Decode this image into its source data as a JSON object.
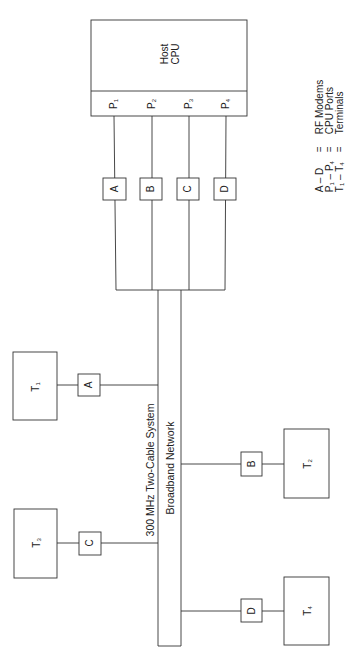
{
  "diagram": {
    "host": {
      "line1": "Host",
      "line2": "CPU"
    },
    "ports": [
      {
        "letter": "P",
        "sub": "1"
      },
      {
        "letter": "P",
        "sub": "2"
      },
      {
        "letter": "P",
        "sub": "3"
      },
      {
        "letter": "P",
        "sub": "4"
      }
    ],
    "host_modems": [
      "A",
      "B",
      "C",
      "D"
    ],
    "bus": {
      "line1": "300 MHz Two-Cable System",
      "line2": "Broadband Network"
    },
    "terminals": [
      {
        "letter": "T",
        "sub": "1",
        "modem": "A"
      },
      {
        "letter": "T",
        "sub": "2",
        "modem": "B"
      },
      {
        "letter": "T",
        "sub": "3",
        "modem": "C"
      },
      {
        "letter": "T",
        "sub": "4",
        "modem": "D"
      }
    ],
    "legend": [
      {
        "key": "A – D",
        "eq": "=",
        "value": "RF Modems"
      },
      {
        "key_a": "P",
        "key_a_sub": "1",
        "dash": " – ",
        "key_b": "P",
        "key_b_sub": "4",
        "eq": "=",
        "value": "CPU Ports"
      },
      {
        "key_a": "T",
        "key_a_sub": "1",
        "dash": " – ",
        "key_b": "T",
        "key_b_sub": "4",
        "eq": "=",
        "value": "Terminals"
      }
    ]
  },
  "colors": {
    "line": "#333333",
    "background": "#ffffff"
  }
}
